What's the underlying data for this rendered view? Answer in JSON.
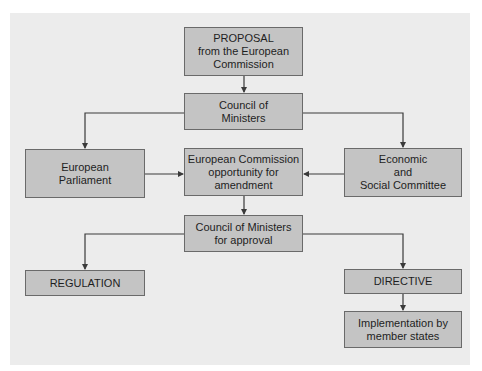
{
  "diagram": {
    "type": "flowchart",
    "title": "",
    "nodes": {
      "proposal": {
        "lines": [
          "PROPOSAL",
          "from the European",
          "Commission"
        ]
      },
      "council": {
        "lines": [
          "Council of",
          "Ministers"
        ]
      },
      "parliament": {
        "lines": [
          "European",
          "Parliament"
        ]
      },
      "amendment": {
        "lines": [
          "European Commission",
          "opportunity for",
          "amendment"
        ]
      },
      "esc": {
        "lines": [
          "Economic",
          "and",
          "Social Committee"
        ]
      },
      "approval": {
        "lines": [
          "Council of Ministers",
          "for approval"
        ]
      },
      "regulation": {
        "lines": [
          "REGULATION"
        ]
      },
      "directive": {
        "lines": [
          "DIRECTIVE"
        ]
      },
      "implementation": {
        "lines": [
          "Implementation by",
          "member states"
        ]
      }
    },
    "edges": [
      {
        "from": "proposal",
        "to": "council"
      },
      {
        "from": "council",
        "to": "parliament"
      },
      {
        "from": "council",
        "to": "esc"
      },
      {
        "from": "parliament",
        "to": "amendment"
      },
      {
        "from": "esc",
        "to": "amendment"
      },
      {
        "from": "amendment",
        "to": "approval"
      },
      {
        "from": "approval",
        "to": "regulation"
      },
      {
        "from": "approval",
        "to": "directive"
      },
      {
        "from": "directive",
        "to": "implementation"
      }
    ],
    "colors": {
      "panel": "#ececec",
      "box_fill": "#c4c4c4",
      "box_border": "#6a6a6a",
      "line": "#3a3a3a",
      "text": "#1e1e1e"
    }
  }
}
